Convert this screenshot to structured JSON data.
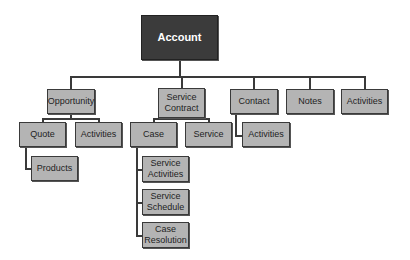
{
  "diagram": {
    "type": "hierarchy",
    "root": {
      "label": "Account"
    },
    "level1": [
      {
        "label": "Opportunity"
      },
      {
        "label": "Service\nContract"
      },
      {
        "label": "Contact"
      },
      {
        "label": "Notes"
      },
      {
        "label": "Activities"
      }
    ],
    "opportunity_children": [
      {
        "label": "Quote"
      },
      {
        "label": "Activities"
      }
    ],
    "quote_children": [
      {
        "label": "Products"
      }
    ],
    "service_contract_children": [
      {
        "label": "Case"
      },
      {
        "label": "Service"
      }
    ],
    "case_children": [
      {
        "label": "Service\nActivities"
      },
      {
        "label": "Service\nSchedule"
      },
      {
        "label": "Case\nResolution"
      }
    ],
    "contact_children": [
      {
        "label": "Activities"
      }
    ],
    "colors": {
      "root_fill": "#3b3b3b",
      "node_fill": "#b4b4b4",
      "line": "#3a3a3a"
    }
  }
}
